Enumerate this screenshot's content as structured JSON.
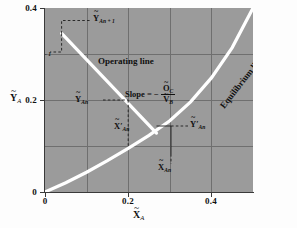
{
  "chart_data": {
    "type": "line",
    "title": "",
    "xlabel": "X̃_A",
    "ylabel": "Ỹ_A",
    "xlim": [
      0,
      0.5
    ],
    "ylim": [
      0,
      0.4
    ],
    "xticks": [
      "0",
      "0.2",
      "0.4"
    ],
    "yticks": [
      "0",
      "0.2",
      "0.4"
    ],
    "xtick_values": [
      0,
      0.2,
      0.4
    ],
    "ytick_values": [
      0,
      0.2,
      0.4
    ],
    "grid": true,
    "grid_spacing": 0.1,
    "legend": "none",
    "series": [
      {
        "name": "Operating line",
        "type": "line",
        "color": "#ffffff",
        "x": [
          0.04,
          0.268
        ],
        "y": [
          0.345,
          0.128
        ]
      },
      {
        "name": "Equilibrium line",
        "type": "line",
        "color": "#ffffff",
        "x": [
          0.0,
          0.05,
          0.1,
          0.15,
          0.2,
          0.25,
          0.3,
          0.35,
          0.4,
          0.45,
          0.5
        ],
        "y": [
          0.0,
          0.02,
          0.043,
          0.068,
          0.095,
          0.123,
          0.155,
          0.196,
          0.248,
          0.314,
          0.4
        ]
      }
    ]
  },
  "axes": {
    "y_title": {
      "var": "Y",
      "sub": "A"
    },
    "x_title": {
      "var": "X",
      "sub": "A"
    },
    "y_ticks": [
      {
        "label": "0.4",
        "value": 0.4
      },
      {
        "label": "0.2",
        "value": 0.2
      },
      {
        "label": "0",
        "value": 0.0
      }
    ],
    "x_ticks": [
      {
        "label": "0",
        "value": 0.0
      },
      {
        "label": "0.2",
        "value": 0.2
      },
      {
        "label": "0.4",
        "value": 0.4
      }
    ]
  },
  "annotations": {
    "operating_line_label": "Operating line",
    "equilibrium_line_label": "Equilibrium line",
    "slope": {
      "prefix": "Slope = −",
      "numerator_var": "O",
      "numerator_sub": "C",
      "denominator_var": "V",
      "denominator_sub": "B"
    },
    "points": [
      {
        "name": "y-an-plus-1",
        "var": "Y",
        "sub": "An + 1",
        "prime": ""
      },
      {
        "name": "x-an-minus-1",
        "var": "X",
        "sub": "An − 1",
        "prime": ""
      },
      {
        "name": "y-an",
        "var": "Y",
        "sub": "An",
        "prime": ""
      },
      {
        "name": "x-an-prime",
        "var": "X",
        "sub": "An",
        "prime": "′"
      },
      {
        "name": "y-an-prime",
        "var": "Y",
        "sub": "An",
        "prime": "′"
      },
      {
        "name": "x-an",
        "var": "X",
        "sub": "An",
        "prime": ""
      }
    ]
  },
  "colors": {
    "plot_background": "#9b9b9b",
    "gridline": "#6f6f6f",
    "curve": "#ffffff",
    "axis": "#3a3a3a",
    "text": "#111111"
  }
}
